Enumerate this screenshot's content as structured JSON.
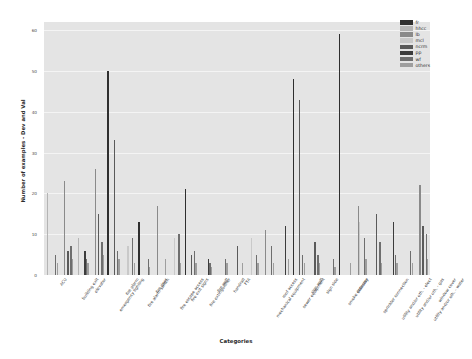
{
  "chart_data": {
    "type": "bar",
    "title": "",
    "xlabel": "Categories",
    "ylabel": "Number of examples - Dev and Val",
    "ylim": [
      0,
      62
    ],
    "yticks": [
      0,
      10,
      20,
      30,
      40,
      50,
      60
    ],
    "grid": true,
    "legend_position": "upper right",
    "background": "#e4e4e4",
    "categories": [
      "ACU",
      "building exit",
      "elevator",
      "emergency lighting",
      "fire alarm",
      "fire alarm switch",
      "fire door",
      "fire escape access",
      "fire exit signs",
      "fire extinguisher",
      "fire wall",
      "handrail",
      "FTA",
      "mechanical equipment",
      "roof access",
      "sewer equipment",
      "sign wall",
      "sign side",
      "smoke detector",
      "stairway",
      "sprinkler connection",
      "utility and/or oth. - elect",
      "utility and/or oth. - gas",
      "utility and/or oth. - water",
      "window cover"
    ],
    "series": [
      {
        "name": "fr",
        "color": "#2f2f2f",
        "values": [
          0,
          0,
          0,
          0,
          50,
          0,
          13,
          0,
          0,
          21,
          0,
          0,
          0,
          0,
          0,
          0,
          48,
          0,
          0,
          59,
          0,
          0,
          0,
          0,
          0
        ]
      },
      {
        "name": "hhcc",
        "color": "#b4b4b4",
        "values": [
          20,
          0,
          9,
          0,
          0,
          0,
          0,
          0,
          0,
          0,
          0,
          0,
          0,
          0,
          0,
          0,
          0,
          0,
          0,
          0,
          0,
          0,
          0,
          0,
          0
        ]
      },
      {
        "name": "lb",
        "color": "#8a8a8a",
        "values": [
          0,
          23,
          0,
          26,
          0,
          0,
          0,
          17,
          0,
          0,
          0,
          0,
          0,
          0,
          11,
          0,
          0,
          0,
          0,
          0,
          17,
          0,
          0,
          0,
          22
        ]
      },
      {
        "name": "mcl",
        "color": "#c9c9c9",
        "values": [
          0,
          0,
          0,
          0,
          0,
          7,
          0,
          0,
          9,
          0,
          0,
          0,
          0,
          9,
          0,
          0,
          0,
          0,
          0,
          0,
          13,
          0,
          0,
          0,
          0
        ]
      },
      {
        "name": "ncrm",
        "color": "#5a5a5a",
        "values": [
          0,
          6,
          0,
          15,
          33,
          0,
          0,
          0,
          0,
          5,
          0,
          0,
          7,
          0,
          0,
          0,
          43,
          8,
          0,
          0,
          0,
          15,
          0,
          0,
          12
        ]
      },
      {
        "name": "pp",
        "color": "#3c3c3c",
        "values": [
          0,
          0,
          6,
          0,
          0,
          0,
          0,
          0,
          0,
          0,
          4,
          0,
          0,
          0,
          0,
          12,
          0,
          0,
          0,
          0,
          0,
          0,
          13,
          0,
          0
        ]
      },
      {
        "name": "wf",
        "color": "#6e6e6e",
        "values": [
          5,
          7,
          4,
          8,
          6,
          9,
          4,
          0,
          10,
          6,
          3,
          4,
          0,
          5,
          7,
          0,
          5,
          5,
          4,
          0,
          9,
          8,
          5,
          6,
          10
        ]
      },
      {
        "name": "others",
        "color": "#9e9e9e",
        "values": [
          3,
          4,
          3,
          5,
          4,
          3,
          2,
          4,
          3,
          3,
          2,
          3,
          3,
          3,
          3,
          4,
          3,
          3,
          2,
          3,
          4,
          3,
          3,
          3,
          4
        ]
      }
    ]
  },
  "legend": {
    "items": [
      {
        "label": "fr"
      },
      {
        "label": "hhcc"
      },
      {
        "label": "lb"
      },
      {
        "label": "mcl"
      },
      {
        "label": "ncrm"
      },
      {
        "label": "pp"
      },
      {
        "label": "wf"
      },
      {
        "label": "others"
      }
    ]
  }
}
